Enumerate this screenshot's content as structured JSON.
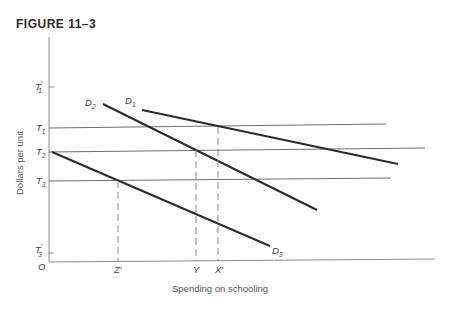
{
  "figure": {
    "title": "FIGURE  11–3"
  },
  "axes": {
    "ylabel": "Dollars per unit",
    "xlabel": "Spending on schooling",
    "origin_label": "O"
  },
  "y_labels": {
    "T1p": {
      "main": "T",
      "sub": "1",
      "prime": "′"
    },
    "T1": {
      "main": "T",
      "sub": "1"
    },
    "T2": {
      "main": "T",
      "sub": "2"
    },
    "T3": {
      "main": "T",
      "sub": "3"
    },
    "T3p": {
      "main": "T",
      "sub": "3",
      "prime": "′"
    }
  },
  "x_labels": {
    "Zp": "Z′",
    "Y": "Y",
    "Xp": "X′"
  },
  "curve_labels": {
    "D1": {
      "main": "D",
      "sub": "1"
    },
    "D2": {
      "main": "D",
      "sub": "2"
    },
    "D3": {
      "main": "D",
      "sub": "3"
    }
  },
  "colors": {
    "axis": "#8a8a8a",
    "horizontal": "#6e6e6e",
    "curve": "#2b2b2b",
    "dashed": "#8a8a8a"
  }
}
